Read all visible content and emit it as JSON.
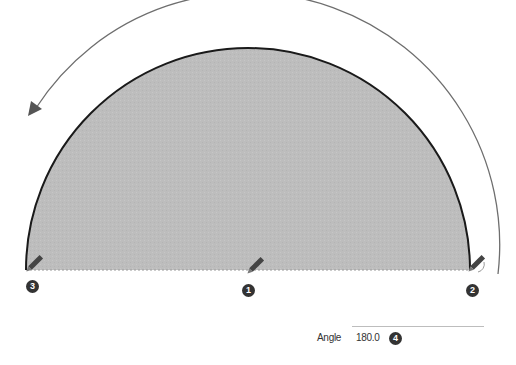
{
  "diagram": {
    "shape": "semicircle",
    "fill_color": "#bfbfbf",
    "edge_color": "#1a1a1a",
    "arrow_color": "#666666",
    "arrow_direction": "counter-clockwise",
    "points": [
      {
        "id": "1",
        "label": "1",
        "role": "center"
      },
      {
        "id": "2",
        "label": "2",
        "role": "start"
      },
      {
        "id": "3",
        "label": "3",
        "role": "end"
      }
    ]
  },
  "vcb": {
    "label": "Angle",
    "value": "180.0",
    "step_badge": "4"
  }
}
